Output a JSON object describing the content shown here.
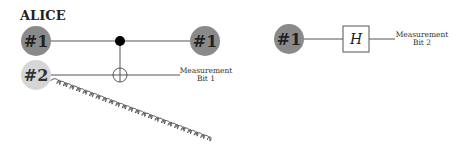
{
  "left_circuit": {
    "title": "ALICE",
    "qubit1_start_label": "#1",
    "qubit1_end_label": "#1",
    "qubit2_label": "#2",
    "measurement_label_line1": "Measurement",
    "measurement_label_line2": "Bit 1",
    "gate": "CNOT"
  },
  "right_circuit": {
    "qubit_label": "#1",
    "gate_label": "H",
    "measurement_label_line1": "Measurement",
    "measurement_label_line2": "Bit 2"
  },
  "colors": {
    "dark_qubit": "#8a8a8a",
    "light_qubit": "#d6d6d6",
    "line": "#555555",
    "text": "#222222"
  }
}
